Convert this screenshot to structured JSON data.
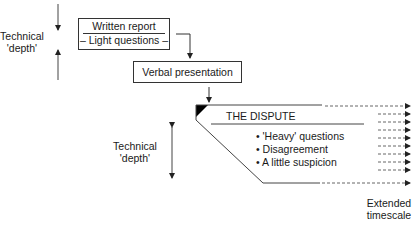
{
  "top_depth_label": [
    "Technical",
    "'depth'"
  ],
  "written_report": {
    "title": "Written report",
    "subtitle": "– Light questions –"
  },
  "verbal_presentation": {
    "label": "Verbal presentation"
  },
  "dispute": {
    "title": "THE DISPUTE",
    "bullets": [
      "'Heavy' questions",
      "Disagreement",
      "A little suspicion"
    ]
  },
  "bottom_depth_label": [
    "Technical",
    "'depth'"
  ],
  "timescale_label": [
    "Extended",
    "timescale"
  ],
  "colors": {
    "line": "#333333",
    "dashed": "#555555",
    "fill": "#000000"
  }
}
